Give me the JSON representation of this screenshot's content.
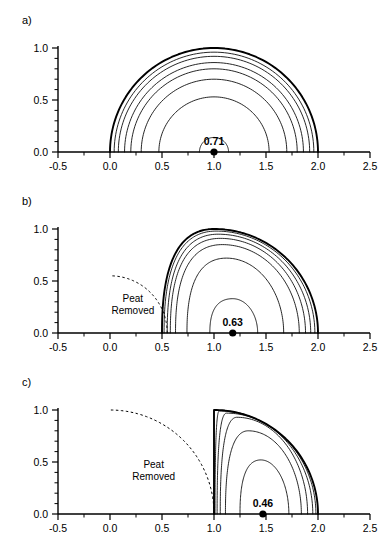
{
  "figure": {
    "type": "contour-figure",
    "panels": [
      {
        "label": "a)",
        "name": "panel-a",
        "center_value": "0.71",
        "center_point": [
          1.0,
          0.0
        ],
        "peat_removed_label": null,
        "dashed_arc_radius": null
      },
      {
        "label": "b)",
        "name": "panel-b",
        "center_value": "0.63",
        "center_point": [
          1.18,
          0.0
        ],
        "peat_removed_label": "Peat\nRemoved",
        "peat_removed_line1": "Peat",
        "peat_removed_line2": "Removed",
        "dashed_arc_radius": 0.55
      },
      {
        "label": "c)",
        "name": "panel-c",
        "center_value": "0.46",
        "center_point": [
          1.47,
          0.0
        ],
        "peat_removed_label": "Peat\nRemoved",
        "peat_removed_line1": "Peat",
        "peat_removed_line2": "Removed",
        "dashed_arc_radius": 1.0
      }
    ]
  },
  "axes": {
    "x": {
      "min": -0.5,
      "max": 2.5,
      "major_ticks": [
        -0.5,
        0.0,
        0.5,
        1.0,
        1.5,
        2.0,
        2.5
      ],
      "tick_labels": [
        "-0.5",
        "0.0",
        "0.5",
        "1.0",
        "1.5",
        "2.0",
        "2.5"
      ],
      "minor_tick_step": 0.25,
      "label": ""
    },
    "y": {
      "min": 0.0,
      "max": 1.05,
      "major_ticks": [
        0.0,
        0.5,
        1.0
      ],
      "tick_labels": [
        "0.0",
        "0.5",
        "1.0"
      ],
      "minor_tick_step": 0.1,
      "label": ""
    }
  },
  "chart_data": {
    "type": "line",
    "title": "",
    "xlabel": "",
    "ylabel": "",
    "xlim": [
      -0.5,
      2.5
    ],
    "ylim": [
      0.0,
      1.05
    ],
    "grid": false,
    "legend": "none",
    "panels": [
      {
        "name": "a",
        "label": "a)",
        "dome_center_x": 1.0,
        "dome_radius": 1.0,
        "marker": {
          "x": 1.0,
          "y": 0.0,
          "label": "0.71"
        },
        "dashed_arc": null,
        "contours": [
          {
            "level": 1.0,
            "type": "semicircle",
            "cx": 1.0,
            "r": 1.0,
            "weight": "heavy"
          },
          {
            "level": 0.95,
            "type": "semicircle",
            "cx": 1.0,
            "r": 0.96,
            "weight": "normal"
          },
          {
            "level": 0.9,
            "type": "semicircle",
            "cx": 1.0,
            "r": 0.92,
            "weight": "normal"
          },
          {
            "level": 0.85,
            "type": "semicircle",
            "cx": 1.0,
            "r": 0.86,
            "weight": "normal"
          },
          {
            "level": 0.8,
            "type": "semicircle",
            "cx": 1.0,
            "r": 0.8,
            "weight": "normal"
          },
          {
            "level": 0.7,
            "type": "semicircle",
            "cx": 1.0,
            "r": 0.7,
            "weight": "normal"
          },
          {
            "level": 0.53,
            "type": "semicircle",
            "cx": 1.0,
            "r": 0.53,
            "weight": "normal"
          },
          {
            "level": 0.14,
            "type": "semicircle",
            "cx": 1.0,
            "r": 0.14,
            "weight": "normal"
          }
        ],
        "axis_crossings_left": [
          0.0,
          0.04,
          0.08,
          0.14,
          0.2,
          0.3,
          0.47,
          0.86
        ],
        "axis_crossings_right": [
          2.0,
          1.96,
          1.92,
          1.86,
          1.8,
          1.7,
          1.53,
          1.14
        ]
      },
      {
        "name": "b",
        "label": "b)",
        "dome_center_x": 1.0,
        "dome_radius": 1.0,
        "marker": {
          "x": 1.18,
          "y": 0.0,
          "label": "0.63"
        },
        "dashed_arc": {
          "cx": 0.0,
          "cy": 0.0,
          "r": 0.55,
          "start": [
            0.55,
            0.0
          ],
          "end": [
            0.15,
            0.52
          ]
        },
        "excavation_note": "Peat Removed",
        "contours": [
          {
            "level": 1.0,
            "weight": "heavy",
            "left_foot": 0.5,
            "right_foot": 2.0,
            "apex_x": 1.0,
            "apex_y": 1.0
          },
          {
            "level": 0.95,
            "weight": "normal",
            "left_foot": 0.52,
            "right_foot": 1.97,
            "apex_x": 1.02,
            "apex_y": 0.98
          },
          {
            "level": 0.9,
            "weight": "normal",
            "left_foot": 0.55,
            "right_foot": 1.93,
            "apex_x": 1.04,
            "apex_y": 0.95
          },
          {
            "level": 0.85,
            "weight": "normal",
            "left_foot": 0.58,
            "right_foot": 1.88,
            "apex_x": 1.06,
            "apex_y": 0.91
          },
          {
            "level": 0.8,
            "weight": "normal",
            "left_foot": 0.63,
            "right_foot": 1.82,
            "apex_x": 1.08,
            "apex_y": 0.85
          },
          {
            "level": 0.7,
            "weight": "normal",
            "left_foot": 0.74,
            "right_foot": 1.67,
            "apex_x": 1.12,
            "apex_y": 0.72
          },
          {
            "level": 0.55,
            "weight": "normal",
            "left_foot": 0.96,
            "right_foot": 1.42,
            "apex_x": 1.18,
            "apex_y": 0.33
          }
        ],
        "axis_crossings_left": [
          0.5,
          0.52,
          0.55,
          0.58,
          0.63,
          0.74,
          0.96
        ],
        "axis_crossings_right": [
          2.0,
          1.97,
          1.93,
          1.88,
          1.82,
          1.67,
          1.42
        ]
      },
      {
        "name": "c",
        "label": "c)",
        "dome_center_x": 1.0,
        "dome_radius": 1.0,
        "marker": {
          "x": 1.47,
          "y": 0.0,
          "label": "0.46"
        },
        "dashed_arc": {
          "cx": 0.0,
          "cy": 0.0,
          "r": 1.0,
          "start": [
            1.0,
            0.0
          ],
          "end": [
            0.52,
            0.86
          ]
        },
        "excavation_note": "Peat Removed",
        "contours": [
          {
            "level": 1.0,
            "weight": "heavy",
            "left_foot": 1.0,
            "right_foot": 2.0,
            "apex_x": 1.0,
            "apex_y": 1.0
          },
          {
            "level": 0.95,
            "weight": "normal",
            "left_foot": 1.01,
            "right_foot": 1.98,
            "apex_x": 1.05,
            "apex_y": 0.99
          },
          {
            "level": 0.9,
            "weight": "normal",
            "left_foot": 1.03,
            "right_foot": 1.95,
            "apex_x": 1.12,
            "apex_y": 0.97
          },
          {
            "level": 0.85,
            "weight": "normal",
            "left_foot": 1.06,
            "right_foot": 1.9,
            "apex_x": 1.22,
            "apex_y": 0.93
          },
          {
            "level": 0.75,
            "weight": "normal",
            "left_foot": 1.11,
            "right_foot": 1.84,
            "apex_x": 1.33,
            "apex_y": 0.8
          },
          {
            "level": 0.6,
            "weight": "normal",
            "left_foot": 1.25,
            "right_foot": 1.72,
            "apex_x": 1.45,
            "apex_y": 0.52
          }
        ],
        "axis_crossings_left": [
          1.0,
          1.01,
          1.03,
          1.06,
          1.11,
          1.25
        ],
        "axis_crossings_right": [
          2.0,
          1.98,
          1.95,
          1.9,
          1.84,
          1.72
        ]
      }
    ]
  },
  "colors": {
    "ink": "#000000",
    "background": "#ffffff"
  }
}
